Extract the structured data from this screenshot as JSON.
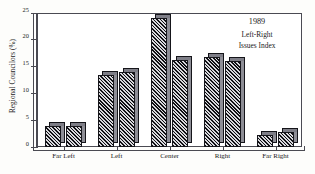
{
  "chart_data": {
    "type": "bar",
    "title": "",
    "subtitle": "",
    "xlabel": "",
    "ylabel": "Regional Councilors (%)",
    "ylim": [
      0,
      25
    ],
    "yticks": [
      0,
      5,
      10,
      15,
      20,
      25
    ],
    "ytick_labels": [
      "0",
      "5",
      "10",
      "15",
      "20",
      "25"
    ],
    "grid": false,
    "legend": false,
    "legend_position": "none",
    "categories": [
      "Far Left",
      "Left",
      "Center",
      "Right",
      "Far Right"
    ],
    "series": [
      {
        "name": "bar-a",
        "values": [
          4.0,
          13.5,
          24.0,
          16.8,
          2.3
        ]
      },
      {
        "name": "bar-b",
        "values": [
          4.0,
          14.0,
          16.3,
          16.1,
          2.8
        ]
      }
    ],
    "bars": [
      {
        "category": "Far Left",
        "index": 0,
        "value": 4.0
      },
      {
        "category": "Far Left",
        "index": 1,
        "value": 4.0
      },
      {
        "category": "Left",
        "index": 0,
        "value": 13.5
      },
      {
        "category": "Left",
        "index": 1,
        "value": 14.0
      },
      {
        "category": "Center",
        "index": 0,
        "value": 24.0
      },
      {
        "category": "Center",
        "index": 1,
        "value": 16.3
      },
      {
        "category": "Right",
        "index": 0,
        "value": 16.8
      },
      {
        "category": "Right",
        "index": 1,
        "value": 16.1
      },
      {
        "category": "Far Right",
        "index": 0,
        "value": 2.3
      },
      {
        "category": "Far Right",
        "index": 1,
        "value": 2.8
      }
    ],
    "annotations": {
      "year": "1989",
      "line2": "Left-Right",
      "line3": "Issues Index"
    },
    "colors": {
      "bar_hatch_dark": "#101014",
      "bar_hatch_light": "#d8d8dc",
      "bar_side": "#8e8e96",
      "axis": "#4a4a52",
      "text": "#1a1a1a",
      "background": "#fdfdfb",
      "plot_background": "#ffffff"
    }
  }
}
